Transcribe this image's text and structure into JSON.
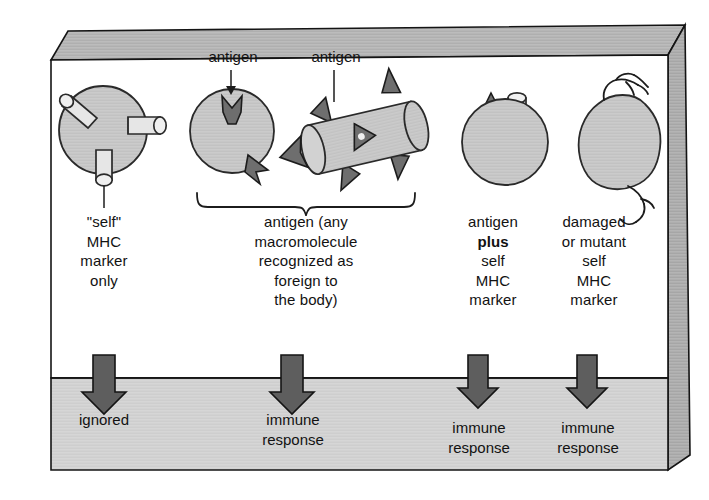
{
  "figure": {
    "title_visible": false,
    "panel": {
      "upper_bg": "#ffffff",
      "lower_bg": "#d4d4d4",
      "edge_face": "#b5b5b5",
      "outline": "#141414"
    },
    "cell_fill": "#c9c9c9",
    "cell_stroke": "#2a2a2a",
    "marker_fill": "#e2e2e2",
    "antigen_fill": "#6e6e6e",
    "arrow_fill": "#5e5e5e",
    "arrow_stroke": "#141414"
  },
  "top_labels": [
    {
      "text": "antigen",
      "x": 230,
      "y": 58
    },
    {
      "text": "antigen",
      "x": 333,
      "y": 58
    }
  ],
  "columns": [
    {
      "id": "self-mhc-only",
      "icon": "cell-with-mhc-markers",
      "caption_lines": [
        "\"self\"",
        "MHC",
        "marker",
        "only"
      ],
      "caption_bold": [],
      "outcome_lines": [
        "ignored"
      ],
      "arrow": true
    },
    {
      "id": "antigen-sphere",
      "icon": "cell-with-antigen-spikes",
      "caption_lines": [],
      "caption_bold": [],
      "outcome_lines": [
        "immune",
        "response"
      ],
      "arrow": true
    },
    {
      "id": "antigen-rod",
      "icon": "bacterium-rod-with-antigen-spikes",
      "caption_lines": [],
      "caption_bold": [],
      "outcome_lines": [],
      "arrow": false
    },
    {
      "id": "antigen-plus-self-mhc",
      "icon": "cell-with-antigen-and-mhc-marker",
      "caption_lines": [
        "antigen",
        "plus",
        "self",
        "MHC",
        "marker"
      ],
      "caption_bold": [
        "plus"
      ],
      "outcome_lines": [
        "immune",
        "response"
      ],
      "arrow": true
    },
    {
      "id": "damaged-or-mutant-self",
      "icon": "damaged-mutant-cell",
      "caption_lines": [
        "damaged",
        "or mutant",
        "self",
        "MHC",
        "marker"
      ],
      "caption_bold": [],
      "outcome_lines": [
        "immune",
        "response"
      ],
      "arrow": true
    }
  ],
  "brace": {
    "label_lines": [
      "antigen (any",
      "macromolecule",
      "recognized as",
      "foreign to",
      "the body)"
    ],
    "x_start": 196,
    "x_end": 416
  },
  "captions": {
    "col1": "\"self\"\nMHC\nmarker\nonly",
    "col4": "antigen\nplus\nself\nMHC\nmarker",
    "col5": "damaged\nor mutant\nself\nMHC\nmarker"
  },
  "outcomes": {
    "o1": "ignored",
    "o2": "immune\nresponse",
    "o4": "immune\nresponse",
    "o5": "immune\nresponse"
  }
}
